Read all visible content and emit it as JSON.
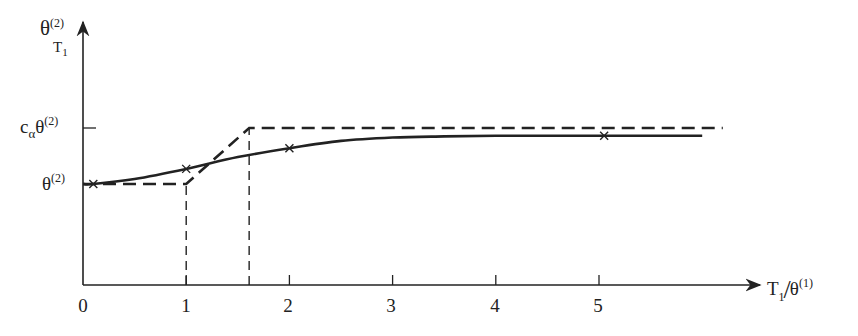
{
  "chart_data": {
    "type": "line",
    "title": "",
    "xlabel": {
      "main": "T",
      "sub": "1",
      "slash": "/",
      "denom": "θ",
      "denom_sup": "(1)"
    },
    "ylabel": {
      "main": "θ",
      "sup": "(2)",
      "sub": "T",
      "sub_sub": "1"
    },
    "x_ticks": [
      "0",
      "1",
      "2",
      "3",
      "4",
      "5"
    ],
    "x_tick_values": [
      0,
      1,
      2,
      3,
      4,
      5
    ],
    "y_tick_labels": [
      {
        "id": "calpha",
        "prefix": "c",
        "prefix_sub": "α",
        "main": "θ",
        "sup": "(2)",
        "value": 1.0
      },
      {
        "id": "theta",
        "prefix": "",
        "prefix_sub": "",
        "main": "θ",
        "sup": "(2)",
        "value": 0.0
      }
    ],
    "xlim": [
      0,
      6.2
    ],
    "grid": false,
    "legend": "none",
    "series": [
      {
        "name": "smooth curve (solid, marked points)",
        "style": "solid",
        "x": [
          0,
          0.1,
          0.5,
          1.0,
          1.5,
          2.0,
          2.5,
          3.0,
          3.5,
          4.0,
          4.5,
          5.0,
          5.5,
          6.0
        ],
        "y": [
          0.0,
          0.0,
          0.09,
          0.27,
          0.48,
          0.64,
          0.77,
          0.83,
          0.85,
          0.86,
          0.86,
          0.86,
          0.86,
          0.86
        ],
        "markers_x": [
          0.1,
          1.0,
          2.0,
          5.05
        ]
      },
      {
        "name": "piecewise linear approximation (dashed)",
        "style": "dashed",
        "x": [
          0,
          1.0,
          1.61,
          6.2
        ],
        "y": [
          0.0,
          0.0,
          1.0,
          1.0
        ]
      }
    ],
    "guides": [
      {
        "style": "dashed-vertical",
        "x": 1.0,
        "from_y": "axis",
        "to_y": 0.0
      },
      {
        "style": "dashed-vertical",
        "x": 1.61,
        "from_y": "axis",
        "to_y": 1.0
      }
    ]
  }
}
